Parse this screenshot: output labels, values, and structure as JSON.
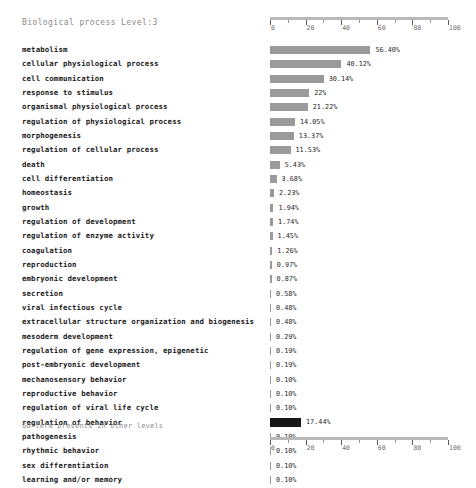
{
  "chart_data": {
    "type": "bar",
    "title": "Biological process Level:3",
    "orientation": "horizontal",
    "xlabel": "",
    "ylabel": "",
    "xlim": [
      0,
      100
    ],
    "grid": false,
    "unit": "%",
    "axis": {
      "major_ticks": [
        0,
        20,
        40,
        60,
        80,
        100
      ],
      "tick_labels": [
        "0",
        "20",
        "40",
        "60",
        "80",
        "100"
      ],
      "minor_ticks": [
        10,
        30,
        50,
        70,
        90
      ],
      "position_top": true,
      "position_bottom": true
    },
    "bar_color": "#9a9a9a",
    "footer_bar_color": "#161616",
    "categories": [
      "metabolism",
      "cellular physiological process",
      "cell communication",
      "response to stimulus",
      "organismal physiological process",
      "regulation of physiological process",
      "morphogenesis",
      "regulation of cellular process",
      "death",
      "cell differentiation",
      "homeostasis",
      "growth",
      "regulation of development",
      "regulation of enzyme activity",
      "coagulation",
      "reproduction",
      "embryonic development",
      "secretion",
      "viral infectious cycle",
      "extracellular structure organization and biogenesis",
      "mesoderm development",
      "regulation of gene expression, epigenetic",
      "post-embryonic development",
      "mechanosensory behavior",
      "reproductive behavior",
      "regulation of viral life cycle",
      "regulation of behavior",
      "pathogenesis",
      "rhythmic behavior",
      "sex differentiation",
      "learning and/or memory"
    ],
    "values": [
      56.4,
      40.12,
      30.14,
      22.0,
      21.22,
      14.05,
      13.37,
      11.53,
      5.43,
      3.68,
      2.23,
      1.94,
      1.74,
      1.45,
      1.26,
      0.97,
      0.87,
      0.58,
      0.48,
      0.48,
      0.29,
      0.19,
      0.19,
      0.1,
      0.1,
      0.1,
      0.1,
      0.1,
      0.1,
      0.1,
      0.1
    ],
    "value_labels": [
      "56.40%",
      "40.12%",
      "30.14%",
      "22%",
      "21.22%",
      "14.05%",
      "13.37%",
      "11.53%",
      "5.43%",
      "3.68%",
      "2.23%",
      "1.94%",
      "1.74%",
      "1.45%",
      "1.26%",
      "0.97%",
      "0.87%",
      "0.58%",
      "0.48%",
      "0.48%",
      "0.29%",
      "0.19%",
      "0.19%",
      "0.10%",
      "0.10%",
      "0.10%",
      "0.10%",
      "0.10%",
      "0.10%",
      "0.10%",
      "0.10%"
    ],
    "footer": {
      "label": "GO term presents in other levels",
      "value": 17.44,
      "value_label": "17.44%"
    }
  }
}
